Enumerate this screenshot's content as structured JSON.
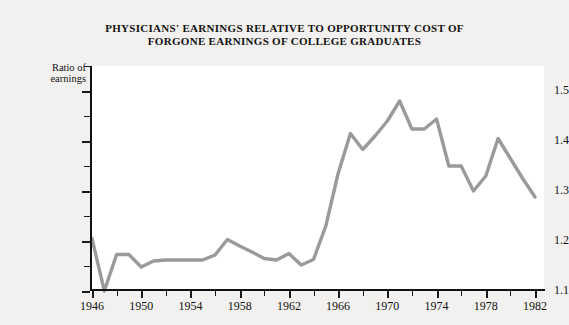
{
  "figure": {
    "title_line1": "PHYSICIANS' EARNINGS RELATIVE TO OPPORTUNITY COST OF",
    "title_line2": "FORGONE EARNINGS OF COLLEGE GRADUATES",
    "y_axis_title_line1": "Ratio of",
    "y_axis_title_line2": "earnings",
    "line_color": "#9a9a9a",
    "axis_color": "#111111",
    "background_color": "#f2f1ef",
    "plot_background_color": "#ffffff"
  },
  "chart_data": {
    "type": "line",
    "title": "PHYSICIANS' EARNINGS RELATIVE TO OPPORTUNITY COST OF FORGONE EARNINGS OF COLLEGE GRADUATES",
    "xlabel": "",
    "ylabel": "Ratio of earnings",
    "xlim": [
      1946,
      1982
    ],
    "ylim": [
      1.1,
      1.55
    ],
    "grid": false,
    "legend": null,
    "x_major_ticks": [
      1946,
      1950,
      1954,
      1958,
      1962,
      1966,
      1970,
      1974,
      1978,
      1982
    ],
    "x_minor_ticks": [
      1948,
      1952,
      1956,
      1960,
      1964,
      1968,
      1972,
      1976,
      1980
    ],
    "y_major_ticks": [
      1.1,
      1.2,
      1.3,
      1.4,
      1.5
    ],
    "y_minor_ticks": [
      1.15,
      1.25,
      1.35,
      1.45,
      1.55
    ],
    "x_tick_labels": [
      "1946",
      "1950",
      "1954",
      "1958",
      "1962",
      "1966",
      "1970",
      "1974",
      "1978",
      "1982"
    ],
    "y_tick_labels": [
      "1.1",
      "1.2",
      "1.3",
      "1.4",
      "1.5"
    ],
    "x": [
      1946,
      1947,
      1948,
      1949,
      1950,
      1951,
      1952,
      1953,
      1954,
      1955,
      1956,
      1957,
      1958,
      1959,
      1960,
      1961,
      1962,
      1963,
      1964,
      1965,
      1966,
      1967,
      1968,
      1969,
      1970,
      1971,
      1972,
      1973,
      1974,
      1975,
      1976,
      1977,
      1978,
      1979,
      1980,
      1981,
      1982
    ],
    "values": [
      1.205,
      1.1,
      1.173,
      1.173,
      1.148,
      1.16,
      1.162,
      1.162,
      1.162,
      1.162,
      1.172,
      1.203,
      1.19,
      1.178,
      1.165,
      1.162,
      1.175,
      1.152,
      1.163,
      1.23,
      1.335,
      1.415,
      1.383,
      1.41,
      1.44,
      1.48,
      1.424,
      1.424,
      1.444,
      1.35,
      1.35,
      1.3,
      1.33,
      1.405,
      1.365,
      1.325,
      1.288
    ]
  }
}
